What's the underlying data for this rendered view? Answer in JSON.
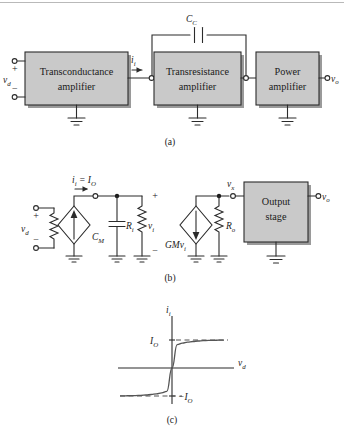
{
  "figure": {
    "captions": {
      "a": "(a)",
      "b": "(b)",
      "c": "(c)"
    }
  },
  "part_a": {
    "blocks": [
      {
        "name": "transconductance-amplifier",
        "line1": "Transconductance",
        "line2": "amplifier"
      },
      {
        "name": "transresistance-amplifier",
        "line1": "Transresistance",
        "line2": "amplifier"
      },
      {
        "name": "power-amplifier",
        "line1": "Power",
        "line2": "amplifier"
      }
    ],
    "labels": {
      "input_voltage": "v",
      "input_voltage_sub": "d",
      "plus_sign": "+",
      "minus_sign": "−",
      "input_current": "i",
      "input_current_sub": "i",
      "output_voltage": "v",
      "output_voltage_sub": "o",
      "compensation_cap": "C",
      "compensation_cap_sub": "C"
    }
  },
  "part_b": {
    "labels": {
      "input_voltage": "v",
      "input_voltage_sub": "d",
      "plus_sign": "+",
      "minus_sign": "−",
      "current_equation": "i",
      "current_equation_sub1": "i",
      "current_equation_eq": " = I",
      "current_equation_sub2": "O",
      "miller_cap": "C",
      "miller_cap_sub": "M",
      "input_resistance": "R",
      "input_resistance_sub": "i",
      "node_voltage_i": "v",
      "node_voltage_i_sub": "i",
      "vi_plus": "+",
      "vi_minus": "−",
      "dependent_source": "GMv",
      "dependent_source_sub": "i",
      "output_resistance": "R",
      "output_resistance_sub": "o",
      "node_voltage_x": "v",
      "node_voltage_x_sub": "x",
      "output_voltage": "v",
      "output_voltage_sub": "o"
    },
    "blocks": [
      {
        "name": "output-stage",
        "line1": "Output",
        "line2": "stage"
      }
    ]
  },
  "chart_data": {
    "type": "line",
    "title": "",
    "xlabel": "v_d",
    "ylabel": "i_i",
    "axis_labels": {
      "y": "i",
      "y_sub": "i",
      "x": "v",
      "x_sub": "d"
    },
    "tick_labels": {
      "positive_saturation": "I",
      "positive_saturation_sub": "O",
      "negative_saturation": "−I",
      "negative_saturation_sub": "O"
    },
    "ylim": [
      -1.35,
      1.35
    ],
    "xlim": [
      -1.0,
      1.0
    ],
    "grid": false,
    "legend": false,
    "saturation_levels": {
      "positive": 1.0,
      "negative": -1.0
    },
    "x": [
      -1.0,
      -0.9,
      -0.8,
      -0.7,
      -0.6,
      -0.5,
      -0.4,
      -0.3,
      -0.2,
      -0.1,
      0.0,
      0.1,
      0.2,
      0.3,
      0.4,
      0.5,
      0.6,
      0.7,
      0.8,
      0.9,
      1.0
    ],
    "values": [
      -0.9951,
      -0.9926,
      -0.989,
      -0.9837,
      -0.9757,
      -0.964,
      -0.9468,
      -0.9217,
      -0.8854,
      -0.8337,
      0.0,
      0.8337,
      0.8854,
      0.9217,
      0.9468,
      0.964,
      0.9757,
      0.9837,
      0.989,
      0.9926,
      0.9951
    ],
    "asymptote_guides": [
      {
        "name": "positive-asymptote",
        "y": 1.0,
        "style": "dashed"
      },
      {
        "name": "negative-asymptote",
        "y": -1.0,
        "style": "dashed"
      }
    ]
  }
}
